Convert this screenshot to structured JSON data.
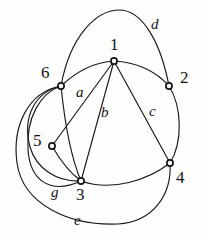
{
  "figure": {
    "type": "graph-diagram",
    "background_color": "#fdfdfb",
    "stroke_color": "#19191c",
    "width": 207,
    "height": 233
  },
  "vertices": [
    {
      "id": "1",
      "label": "1",
      "x": 114,
      "y": 61,
      "label_x": 110,
      "label_y": 36
    },
    {
      "id": "2",
      "label": "2",
      "x": 169,
      "y": 86,
      "label_x": 180,
      "label_y": 69
    },
    {
      "id": "3",
      "label": "3",
      "x": 81,
      "y": 181,
      "label_x": 76,
      "label_y": 186
    },
    {
      "id": "4",
      "label": "4",
      "x": 170,
      "y": 163,
      "label_x": 176,
      "label_y": 169
    },
    {
      "id": "5",
      "label": "5",
      "x": 52,
      "y": 146,
      "label_x": 33,
      "label_y": 132
    },
    {
      "id": "6",
      "label": "6",
      "x": 61,
      "y": 86,
      "label_x": 41,
      "label_y": 64
    }
  ],
  "edge_labels": [
    {
      "id": "a",
      "label": "a",
      "x": 76,
      "y": 85,
      "edge": "1-5"
    },
    {
      "id": "b",
      "label": "b",
      "x": 101,
      "y": 105,
      "edge": "1-3"
    },
    {
      "id": "c",
      "label": "c",
      "x": 149,
      "y": 104,
      "edge": "1-4"
    },
    {
      "id": "d",
      "label": "d",
      "x": 151,
      "y": 17,
      "edge": "6-2"
    },
    {
      "id": "e",
      "label": "e",
      "x": 74,
      "y": 213,
      "edge": "6-4"
    },
    {
      "id": "g",
      "label": "g",
      "x": 51,
      "y": 185,
      "edge": "6-3"
    }
  ],
  "edges": [
    {
      "id": "d",
      "from": "6",
      "to": "2",
      "label": "d",
      "path": "M 61 86 C 70 36 96 11 118 10 C 143 9 161 44 169 86"
    },
    {
      "id": "61",
      "from": "6",
      "to": "1",
      "label": "",
      "path": "M 61 86 C 78 70 96 62 114 61"
    },
    {
      "id": "12",
      "from": "1",
      "to": "2",
      "label": "",
      "path": "M 114 61 C 136 62 156 71 169 86"
    },
    {
      "id": "a",
      "from": "1",
      "to": "5",
      "label": "a",
      "path": "M 114 61 L 52 146"
    },
    {
      "id": "b",
      "from": "1",
      "to": "3",
      "label": "b",
      "path": "M 114 61 L 81 181"
    },
    {
      "id": "c",
      "from": "1",
      "to": "4",
      "label": "c",
      "path": "M 114 61 L 170 163"
    },
    {
      "id": "63",
      "from": "6",
      "to": "3",
      "label": "",
      "path": "M 61 86 C 64 116 70 155 81 181"
    },
    {
      "id": "53",
      "from": "5",
      "to": "3",
      "label": "",
      "path": "M 52 146 C 60 160 70 173 81 181"
    },
    {
      "id": "24",
      "from": "2",
      "to": "4",
      "label": "",
      "path": "M 169 86 C 182 107 183 142 170 163"
    },
    {
      "id": "34",
      "from": "3",
      "to": "4",
      "label": "",
      "path": "M 81 181 C 112 192 148 180 170 163"
    },
    {
      "id": "65",
      "from": "6",
      "to": "5",
      "label": "",
      "path": "M 61 86 C 35 92 22 117 30 147 C 36 168 56 182 81 181"
    },
    {
      "id": "g",
      "from": "6",
      "to": "3",
      "label": "g",
      "path": "M 61 86 C 40 93 26 118 28 150 C 30 178 48 196 81 181"
    },
    {
      "id": "e",
      "from": "6",
      "to": "4",
      "label": "e",
      "path": "M 61 86 C 28 92 12 126 17 163 C 23 205 70 226 118 224 C 152 222 172 196 170 163"
    }
  ]
}
